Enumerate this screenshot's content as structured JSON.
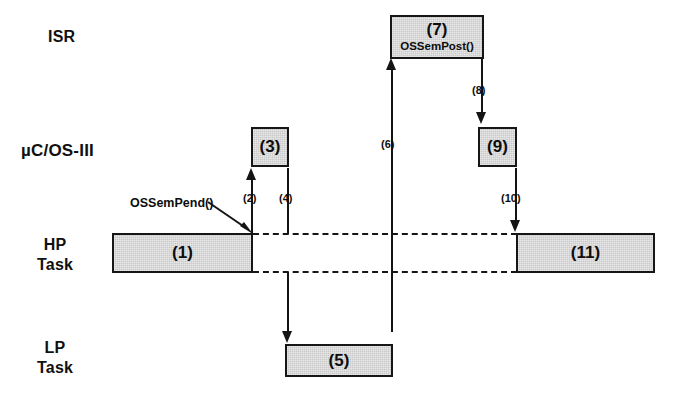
{
  "diagram": {
    "colors": {
      "box_fill": "#c9c9c9",
      "stroke": "#141414",
      "background": "#ffffff"
    },
    "lanes": [
      {
        "id": "isr",
        "label": "ISR"
      },
      {
        "id": "os",
        "label": "µC/OS-III"
      },
      {
        "id": "hp",
        "label": "HP\nTask"
      },
      {
        "id": "lp",
        "label": "LP\nTask"
      }
    ],
    "boxes": [
      {
        "id": "box1",
        "number": "(1)",
        "api": "",
        "lane": "hp"
      },
      {
        "id": "box3",
        "number": "(3)",
        "api": "",
        "lane": "os"
      },
      {
        "id": "box5",
        "number": "(5)",
        "api": "",
        "lane": "lp"
      },
      {
        "id": "box7",
        "number": "(7)",
        "api": "OSSemPost()",
        "lane": "isr"
      },
      {
        "id": "box9",
        "number": "(9)",
        "api": "",
        "lane": "os"
      },
      {
        "id": "box11",
        "number": "(11)",
        "api": "",
        "lane": "hp"
      }
    ],
    "steps": [
      {
        "id": "step2",
        "label": "(2)"
      },
      {
        "id": "step4",
        "label": "(4)"
      },
      {
        "id": "step6",
        "label": "(6)"
      },
      {
        "id": "step8",
        "label": "(8)"
      },
      {
        "id": "step10",
        "label": "(10)"
      }
    ],
    "callouts": [
      {
        "id": "ossempend",
        "label": "OSSemPend()"
      }
    ]
  }
}
